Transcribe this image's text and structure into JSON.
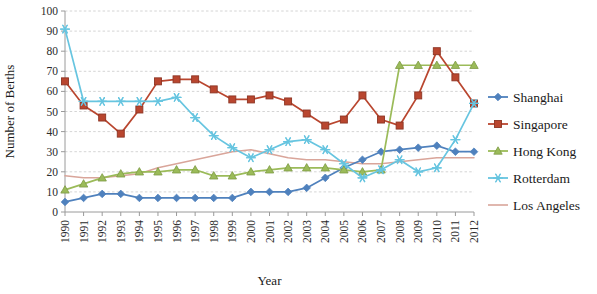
{
  "chart_data": {
    "type": "line",
    "title": "",
    "xlabel": "Year",
    "ylabel": "Number of Berths",
    "ylim": [
      0,
      100
    ],
    "ytick_step": 10,
    "yticks": [
      0,
      10,
      20,
      30,
      40,
      50,
      60,
      70,
      80,
      90,
      100
    ],
    "grid": true,
    "legend_position": "right",
    "categories": [
      "1990",
      "1991",
      "1992",
      "1993",
      "1994",
      "1995",
      "1996",
      "1997",
      "1998",
      "1999",
      "2000",
      "2001",
      "2002",
      "2003",
      "2004",
      "2005",
      "2006",
      "2007",
      "2008",
      "2009",
      "2010",
      "2011",
      "2012"
    ],
    "series": [
      {
        "name": "Shanghai",
        "color": "#4f81bd",
        "marker": "diamond",
        "values": [
          5,
          7,
          9,
          9,
          7,
          7,
          7,
          7,
          7,
          7,
          10,
          10,
          10,
          12,
          17,
          22,
          26,
          30,
          31,
          32,
          33,
          30,
          30
        ]
      },
      {
        "name": "Singapore",
        "color": "#b9462f",
        "marker": "square",
        "values": [
          65,
          53,
          47,
          39,
          51,
          65,
          66,
          66,
          61,
          56,
          56,
          58,
          55,
          49,
          43,
          46,
          58,
          46,
          43,
          58,
          80,
          67,
          54
        ]
      },
      {
        "name": "Hong Kong",
        "color": "#9bbb59",
        "marker": "triangle",
        "values": [
          11,
          14,
          17,
          19,
          20,
          20,
          21,
          21,
          18,
          18,
          20,
          21,
          22,
          22,
          22,
          21,
          20,
          21,
          73,
          73,
          73,
          73,
          73
        ]
      },
      {
        "name": "Rotterdam",
        "color": "#67c5e0",
        "marker": "asterisk",
        "values": [
          91,
          55,
          55,
          55,
          55,
          55,
          57,
          47,
          38,
          32,
          27,
          31,
          35,
          36,
          31,
          24,
          17,
          21,
          26,
          20,
          22,
          36,
          54
        ]
      },
      {
        "name": "Los Angeles",
        "color": "#d9a59a",
        "marker": "none",
        "values": [
          18,
          17,
          17,
          18,
          19,
          22,
          24,
          26,
          28,
          30,
          31,
          29,
          27,
          26,
          26,
          25,
          24,
          24,
          25,
          26,
          27,
          27,
          27
        ]
      }
    ]
  }
}
